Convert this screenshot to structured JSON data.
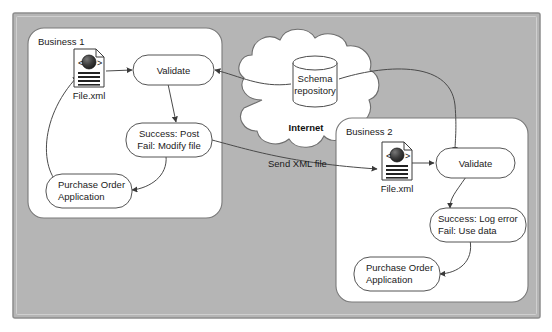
{
  "canvas": {
    "background_color": "#b5b5b5",
    "border_color": "#8f8f8f",
    "page_color": "#ffffff"
  },
  "groups": [
    {
      "id": "business-1",
      "label": "Business 1",
      "fill": "#ffffff",
      "stroke": "#7a7a7a"
    },
    {
      "id": "business-2",
      "label": "Business 2",
      "fill": "#ffffff",
      "stroke": "#7a7a7a"
    }
  ],
  "cloud": {
    "label": "Internet",
    "fill": "#ffffff",
    "stroke": "#6e6e6e"
  },
  "repository": {
    "label_line1": "Schema",
    "label_line2": "repository",
    "fill": "#ffffff",
    "stroke": "#4a4a4a"
  },
  "business1": {
    "file": {
      "caption": "File.xml",
      "icon": "xml-document-icon"
    },
    "validate": {
      "label": "Validate"
    },
    "outcome": {
      "line1": "Success: Post",
      "line2": "Fail: Modify file"
    },
    "application": {
      "line1": "Purchase Order",
      "line2": "Application"
    }
  },
  "business2": {
    "file": {
      "caption": "File.xml",
      "icon": "xml-document-icon"
    },
    "validate": {
      "label": "Validate"
    },
    "outcome": {
      "line1": "Success: Log error",
      "line2": "Fail: Use data"
    },
    "application": {
      "line1": "Purchase Order",
      "line2": "Application"
    }
  },
  "edges": [
    {
      "id": "b1-file-to-validate",
      "label": ""
    },
    {
      "id": "b1-validate-to-outcome",
      "label": ""
    },
    {
      "id": "b1-outcome-to-application",
      "label": ""
    },
    {
      "id": "b1-application-to-file",
      "label": ""
    },
    {
      "id": "repo-to-b1-validate",
      "label": ""
    },
    {
      "id": "b1-outcome-to-b2-file",
      "label": "Send XML file"
    },
    {
      "id": "b2-file-to-validate",
      "label": ""
    },
    {
      "id": "b2-validate-to-outcome",
      "label": ""
    },
    {
      "id": "b2-outcome-to-application",
      "label": ""
    },
    {
      "id": "repo-to-b2-validate",
      "label": ""
    }
  ],
  "colors": {
    "line": "#4a4a4a",
    "node_stroke": "#555555",
    "node_fill": "#ffffff",
    "text": "#1a1a1a"
  }
}
